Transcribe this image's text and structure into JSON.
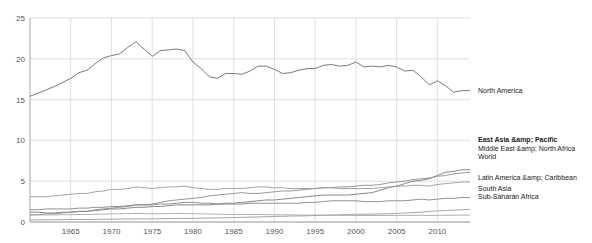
{
  "chart_data": {
    "type": "line",
    "title": "",
    "xlabel": "",
    "ylabel": "",
    "xlim": [
      1960,
      2014
    ],
    "ylim": [
      0,
      25
    ],
    "grid": true,
    "legend_position": "right-inline",
    "x_ticks": [
      "1965",
      "1970",
      "1975",
      "1980",
      "1985",
      "1990",
      "1995",
      "2000",
      "2005",
      "2010"
    ],
    "x_tick_values": [
      1965,
      1970,
      1975,
      1980,
      1985,
      1990,
      1995,
      2000,
      2005,
      2010
    ],
    "y_ticks": [
      "0",
      "5",
      "10",
      "15",
      "20",
      "25"
    ],
    "y_tick_values": [
      0,
      5,
      10,
      15,
      20,
      25
    ],
    "x": [
      1960,
      1961,
      1962,
      1963,
      1964,
      1965,
      1966,
      1967,
      1968,
      1969,
      1970,
      1971,
      1972,
      1973,
      1974,
      1975,
      1976,
      1977,
      1978,
      1979,
      1980,
      1981,
      1982,
      1983,
      1984,
      1985,
      1986,
      1987,
      1988,
      1989,
      1990,
      1991,
      1992,
      1993,
      1994,
      1995,
      1996,
      1997,
      1998,
      1999,
      2000,
      2001,
      2002,
      2003,
      2004,
      2005,
      2006,
      2007,
      2008,
      2009,
      2010,
      2011,
      2012,
      2013,
      2014
    ],
    "series": [
      {
        "name": "North America",
        "color": "#6b6b6b",
        "label_bold": false,
        "values": [
          15.4,
          15.8,
          16.2,
          16.6,
          17.1,
          17.6,
          18.3,
          18.6,
          19.4,
          20.1,
          20.4,
          20.6,
          21.4,
          22.1,
          21.2,
          20.3,
          21.0,
          21.1,
          21.2,
          21.0,
          19.6,
          18.8,
          17.8,
          17.6,
          18.2,
          18.2,
          18.1,
          18.5,
          19.1,
          19.1,
          18.7,
          18.2,
          18.3,
          18.6,
          18.8,
          18.8,
          19.2,
          19.3,
          19.1,
          19.2,
          19.6,
          19.0,
          19.1,
          19.0,
          19.2,
          19.0,
          18.5,
          18.6,
          17.8,
          16.8,
          17.3,
          16.7,
          15.9,
          16.1,
          16.1
        ]
      },
      {
        "name": "East Asia &amp; Pacific",
        "color": "#7a7a7a",
        "label_bold": true,
        "values": [
          1.2,
          1.2,
          1.1,
          1.1,
          1.2,
          1.2,
          1.3,
          1.3,
          1.4,
          1.5,
          1.6,
          1.6,
          1.7,
          1.8,
          1.8,
          1.9,
          1.9,
          2.0,
          2.1,
          2.1,
          2.1,
          2.1,
          2.1,
          2.2,
          2.3,
          2.3,
          2.4,
          2.5,
          2.6,
          2.7,
          2.7,
          2.8,
          2.9,
          3.0,
          3.1,
          3.2,
          3.3,
          3.3,
          3.3,
          3.3,
          3.4,
          3.5,
          3.6,
          3.9,
          4.2,
          4.4,
          4.7,
          5.0,
          5.1,
          5.3,
          5.7,
          6.1,
          6.2,
          6.4,
          6.4
        ]
      },
      {
        "name": "Middle East &amp; North Africa",
        "color": "#8c8c8c",
        "label_bold": false,
        "values": [
          0.9,
          0.9,
          1.0,
          1.0,
          1.1,
          1.2,
          1.3,
          1.3,
          1.5,
          1.6,
          1.7,
          1.8,
          1.9,
          2.1,
          2.1,
          2.2,
          2.4,
          2.6,
          2.7,
          2.8,
          2.9,
          3.0,
          3.2,
          3.3,
          3.4,
          3.5,
          3.6,
          3.5,
          3.5,
          3.6,
          3.7,
          3.8,
          3.8,
          3.9,
          4.0,
          4.1,
          4.2,
          4.2,
          4.3,
          4.3,
          4.4,
          4.5,
          4.5,
          4.6,
          4.8,
          4.9,
          5.0,
          5.2,
          5.3,
          5.4,
          5.6,
          5.7,
          5.9,
          6.0,
          6.1
        ]
      },
      {
        "name": "World",
        "color": "#9a9a9a",
        "label_bold": false,
        "values": [
          3.1,
          3.1,
          3.1,
          3.2,
          3.3,
          3.4,
          3.5,
          3.5,
          3.7,
          3.8,
          4.0,
          4.0,
          4.1,
          4.3,
          4.2,
          4.1,
          4.2,
          4.3,
          4.3,
          4.4,
          4.2,
          4.1,
          4.0,
          4.0,
          4.1,
          4.1,
          4.1,
          4.2,
          4.3,
          4.3,
          4.2,
          4.2,
          4.1,
          4.1,
          4.1,
          4.1,
          4.2,
          4.2,
          4.1,
          4.1,
          4.1,
          4.1,
          4.1,
          4.2,
          4.3,
          4.4,
          4.4,
          4.5,
          4.5,
          4.4,
          4.6,
          4.7,
          4.8,
          4.9,
          4.9
        ]
      },
      {
        "name": "Latin America &amp; Caribbean",
        "color": "#858585",
        "label_bold": false,
        "values": [
          1.5,
          1.5,
          1.6,
          1.6,
          1.6,
          1.6,
          1.7,
          1.7,
          1.8,
          1.8,
          1.9,
          1.9,
          2.0,
          2.1,
          2.1,
          2.1,
          2.2,
          2.2,
          2.3,
          2.4,
          2.4,
          2.3,
          2.3,
          2.2,
          2.2,
          2.2,
          2.2,
          2.3,
          2.3,
          2.3,
          2.3,
          2.3,
          2.3,
          2.3,
          2.4,
          2.4,
          2.5,
          2.6,
          2.6,
          2.6,
          2.6,
          2.5,
          2.5,
          2.5,
          2.6,
          2.6,
          2.6,
          2.7,
          2.8,
          2.7,
          2.8,
          2.9,
          2.9,
          3.0,
          3.0
        ]
      },
      {
        "name": "South Asia",
        "color": "#9c9c9c",
        "label_bold": false,
        "values": [
          0.25,
          0.26,
          0.27,
          0.28,
          0.29,
          0.3,
          0.31,
          0.31,
          0.32,
          0.34,
          0.35,
          0.36,
          0.37,
          0.37,
          0.38,
          0.39,
          0.4,
          0.42,
          0.43,
          0.44,
          0.45,
          0.47,
          0.49,
          0.5,
          0.52,
          0.55,
          0.57,
          0.6,
          0.62,
          0.65,
          0.68,
          0.7,
          0.73,
          0.74,
          0.76,
          0.8,
          0.83,
          0.86,
          0.88,
          0.93,
          0.95,
          0.95,
          0.97,
          0.99,
          1.02,
          1.05,
          1.1,
          1.15,
          1.2,
          1.3,
          1.35,
          1.4,
          1.45,
          1.5,
          1.55
        ]
      },
      {
        "name": "Sub-Saharan Africa",
        "color": "#a6a6a6",
        "label_bold": false,
        "values": [
          0.85,
          0.86,
          0.87,
          0.88,
          0.89,
          0.9,
          0.92,
          0.92,
          0.94,
          0.96,
          1.0,
          1.02,
          1.03,
          1.05,
          1.02,
          1.0,
          1.02,
          1.03,
          1.04,
          1.03,
          1.02,
          1.0,
          0.98,
          0.95,
          0.93,
          0.92,
          0.92,
          0.91,
          0.91,
          0.9,
          0.89,
          0.88,
          0.87,
          0.86,
          0.84,
          0.84,
          0.84,
          0.83,
          0.82,
          0.81,
          0.8,
          0.8,
          0.8,
          0.8,
          0.8,
          0.81,
          0.81,
          0.81,
          0.82,
          0.8,
          0.82,
          0.83,
          0.83,
          0.84,
          0.84
        ]
      }
    ]
  },
  "labels": {
    "north_america": "North America",
    "east_asia_pacific": "East Asia &amp; Pacific",
    "middle_east_north_africa": "Middle East &amp; North Africa",
    "world": "World",
    "latin_america_caribbean": "Latin America &amp; Caribbean",
    "south_asia": "South Asia",
    "sub_saharan_africa": "Sub-Saharan Africa"
  }
}
